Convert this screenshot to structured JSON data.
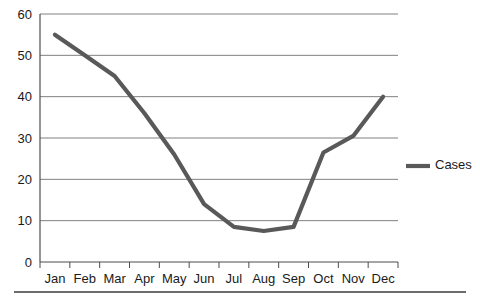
{
  "chart_data": {
    "type": "line",
    "title": "",
    "subtitle": "",
    "xlabel": "",
    "ylabel": "",
    "categories": [
      "Jan",
      "Feb",
      "Mar",
      "Apr",
      "May",
      "Jun",
      "Jul",
      "Aug",
      "Sep",
      "Oct",
      "Nov",
      "Dec"
    ],
    "series": [
      {
        "name": "Cases",
        "values": [
          55,
          50,
          45,
          36,
          26,
          14,
          8.5,
          7.5,
          8.5,
          26.5,
          30.5,
          40
        ],
        "color": "#595959"
      }
    ],
    "ylim": [
      0,
      60
    ],
    "yticks": [
      0,
      10,
      20,
      30,
      40,
      50,
      60
    ],
    "ytick_labels": [
      "0",
      "10",
      "20",
      "30",
      "40",
      "50",
      "60"
    ],
    "grid": true,
    "grid_axis": "y",
    "grid_color": "#808080",
    "axis_color": "#4d4d4d",
    "legend": {
      "position": "right",
      "entries": [
        {
          "label": "Cases",
          "color": "#595959",
          "marker": "line"
        }
      ]
    },
    "footer_rule": true
  }
}
